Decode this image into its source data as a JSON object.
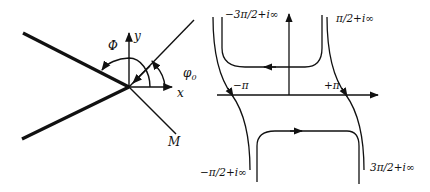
{
  "left_diagram": {
    "labels": {
      "phi_cap": "Φ",
      "y": "y",
      "phi0": "φ",
      "phi0_sub": "0",
      "x": "x",
      "m": "M"
    }
  },
  "right_diagram": {
    "labels": {
      "top_left": "−3π/2+i∞",
      "top_right": "π/2+i∞",
      "minus_pi": "−π",
      "plus_pi": "+π",
      "bottom_left": "−π/2+i∞",
      "bottom_right": "3π/2+i∞"
    }
  },
  "colors": {
    "ink": "#111111",
    "background": "#ffffff"
  }
}
